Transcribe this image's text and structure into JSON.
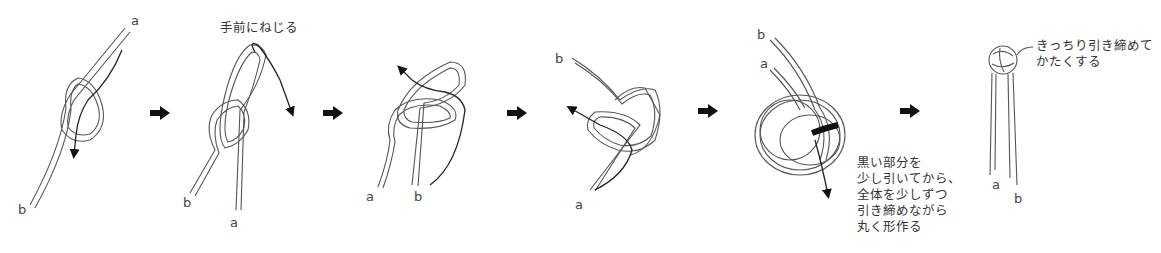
{
  "diagram": {
    "title": "",
    "steps": [
      {
        "index": 1,
        "cord_labels": {
          "a": "a",
          "b": "b"
        },
        "note": ""
      },
      {
        "index": 2,
        "cord_labels": {
          "a": "a",
          "b": "b"
        },
        "note": "手前にねじる"
      },
      {
        "index": 3,
        "cord_labels": {
          "a": "a",
          "b": "b"
        },
        "note": ""
      },
      {
        "index": 4,
        "cord_labels": {
          "a": "a",
          "b": "b"
        },
        "note": ""
      },
      {
        "index": 5,
        "cord_labels": {
          "a": "a",
          "b": "b"
        },
        "note": "黒い部分を\n少し引いてから、\n全体を少しずつ\n引き締めながら\n丸く形作る"
      },
      {
        "index": 6,
        "cord_labels": {
          "a": "a",
          "b": "b"
        },
        "note": "きっちり引き締めて\nかたくする"
      }
    ],
    "arrows_between_steps": 5,
    "colors": {
      "line": "#555555",
      "pull_arrow": "#111111",
      "text": "#333333",
      "background": "#ffffff"
    }
  }
}
